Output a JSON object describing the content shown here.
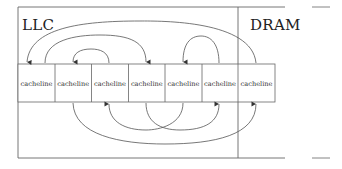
{
  "regions": {
    "llc": {
      "label": "LLC"
    },
    "dram": {
      "label": "DRAM"
    }
  },
  "cells": [
    {
      "label": "cacheline",
      "region": "LLC"
    },
    {
      "label": "cacheline",
      "region": "LLC"
    },
    {
      "label": "cacheline",
      "region": "LLC"
    },
    {
      "label": "cacheline",
      "region": "LLC"
    },
    {
      "label": "cacheline",
      "region": "LLC"
    },
    {
      "label": "cacheline",
      "region": "LLC"
    },
    {
      "label": "cacheline",
      "region": "DRAM"
    }
  ],
  "arrows": {
    "top": [
      {
        "from": 7,
        "to": 1
      },
      {
        "from": 2,
        "to": 4
      },
      {
        "from": 3,
        "to": 2
      },
      {
        "from": 6,
        "to": 5
      }
    ],
    "bottom": [
      {
        "from": 2,
        "to": 7
      },
      {
        "from": 5,
        "to": 3
      },
      {
        "from": 4,
        "to": 6
      }
    ]
  },
  "colors": {
    "line": "#555555",
    "text": "#222222",
    "background": "#ffffff"
  }
}
